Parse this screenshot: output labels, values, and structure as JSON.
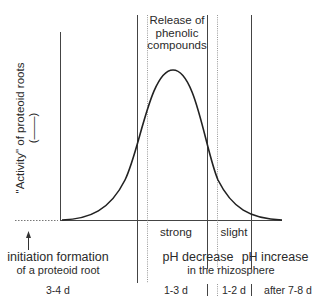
{
  "diagram": {
    "title": "Release of phenolic compounds",
    "title_lines": [
      "Release of",
      "phenolic",
      "compounds"
    ],
    "y_axis_label": "\"Activity\" of proteoid roots",
    "y_axis_legend": "(——)",
    "intensity_labels": {
      "strong": "strong",
      "slight": "slight"
    },
    "events": {
      "initiation_line1": "initiation formation",
      "initiation_line2": "of a proteoid root",
      "ph_decrease": "pH decrease",
      "ph_increase": "pH increase",
      "rhizosphere": "in the rhizosphere"
    },
    "durations": [
      "3-4 d",
      "1-3 d",
      "1-2 d",
      "after 7-8 d"
    ],
    "arrow": "up-arrow",
    "colors": {
      "line": "#2a2a2a",
      "dotted": "#888888",
      "text": "#2a2a2a"
    }
  }
}
